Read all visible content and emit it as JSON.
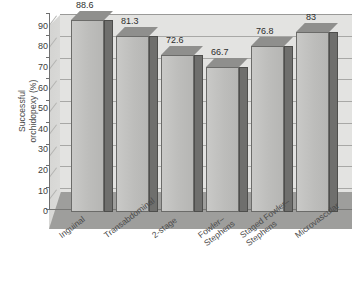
{
  "chart_data": {
    "type": "bar",
    "title": "",
    "xlabel": "",
    "ylabel": "Successful orchidopexy (%)",
    "ylabel_lines": [
      "Successful",
      "orchidopexy (%)"
    ],
    "categories": [
      "Inguinal",
      "Transabdominal",
      "2-stage",
      "Fowler–Stephens",
      "Staged Fowler–Stephens",
      "Microvascular"
    ],
    "category_lines": [
      [
        "Inguinal"
      ],
      [
        "Transabdominal"
      ],
      [
        "2-stage"
      ],
      [
        "Fowler–",
        "Stephens"
      ],
      [
        "Staged Fowler–",
        "Stephens"
      ],
      [
        "Microvascular"
      ]
    ],
    "values": [
      88.6,
      81.3,
      72.6,
      66.7,
      76.8,
      83
    ],
    "data_labels": [
      "88.6",
      "81.3",
      "72.6",
      "66.7",
      "76.8",
      "83"
    ],
    "ylim": [
      0,
      90
    ],
    "ytick_values": [
      0,
      10,
      20,
      30,
      40,
      50,
      60,
      70,
      80,
      90
    ],
    "ytick_labels": [
      "0",
      "10",
      "20",
      "30",
      "40",
      "50",
      "60",
      "70",
      "80",
      "90"
    ],
    "grid": true,
    "legend": null,
    "style": "3d-column",
    "colors": {
      "bar_front": "#c2c2c0",
      "bar_side": "#6f6f6d",
      "back_wall": "#e3e3e1",
      "floor": "#9e9e9c",
      "gridline": "#a8a8a6",
      "axis": "#707070",
      "text": "#3a3a3a"
    }
  }
}
